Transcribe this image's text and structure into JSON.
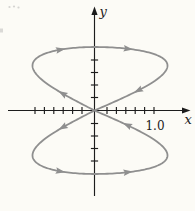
{
  "page": {
    "background": "#fcfbf6"
  },
  "colors": {
    "axis": "#1c1c1c",
    "curve": "#8f8f8f",
    "text": "#1c1c1c"
  },
  "chart_data": {
    "type": "line",
    "subtype": "parametric-figure-eight-lissajous",
    "title": "",
    "xlabel": "x",
    "ylabel": "y",
    "equation": "x = -sin(2t), y = sin(t), 0 <= t <= 2*pi",
    "x_range": [
      -1,
      1
    ],
    "y_range": [
      -1,
      1
    ],
    "x_tick_labels": [
      {
        "value": 1.0,
        "label": "1.0"
      }
    ],
    "x_ticks_per_side": 6,
    "y_ticks_per_side": 4,
    "grid": false,
    "legend": false,
    "direction_arrows": {
      "description": "gray arrowheads showing traversal: from origin up-left around upper loop (rightward across top, down right side back to origin), then down-left around lower loop (rightward across bottom, up right side back to origin)",
      "t_values": [
        0.27,
        1.28,
        1.81,
        2.82,
        3.41,
        4.42,
        4.95,
        6.05
      ]
    },
    "key_points": [
      {
        "t": 0.0,
        "x": 0,
        "y": 0,
        "note": "self-intersection at origin"
      },
      {
        "t": 0.7854,
        "x": -1,
        "y": 0.707,
        "note": "leftmost of upper loop"
      },
      {
        "t": 1.5708,
        "x": 0,
        "y": 1,
        "note": "top of upper loop on y-axis"
      },
      {
        "t": 2.3562,
        "x": 1,
        "y": 0.707,
        "note": "rightmost of upper loop"
      },
      {
        "t": 4.7124,
        "x": 0,
        "y": -1,
        "note": "bottom of lower loop on y-axis"
      }
    ],
    "render": {
      "width": 195,
      "height": 211,
      "origin": [
        94.5,
        110.5
      ],
      "scale_x_left": 62,
      "scale_x_right": 73,
      "scale_y": 63.5,
      "x_axis": {
        "x_start": 8,
        "x_end": 183.5,
        "arrow_tip": 190.5
      },
      "y_axis": {
        "y_start": 196,
        "y_end": 11,
        "arrow_tip": 6.5
      },
      "x_ticks": {
        "first_offset": 12.5,
        "step": 9.4,
        "count": 6,
        "half_len": 3.6
      },
      "y_ticks": {
        "first_offset": 13,
        "step": 12.5,
        "count": 4,
        "half_len": 3.6
      },
      "curve_stroke_width": 1.8,
      "samples": 360
    }
  },
  "scan_artifacts": {
    "dots": [
      [
        9.5,
        7
      ],
      [
        14,
        6.5
      ],
      [
        18.5,
        7.5
      ]
    ],
    "edge_mark": [
      0,
      28.5,
      3,
      4
    ]
  }
}
